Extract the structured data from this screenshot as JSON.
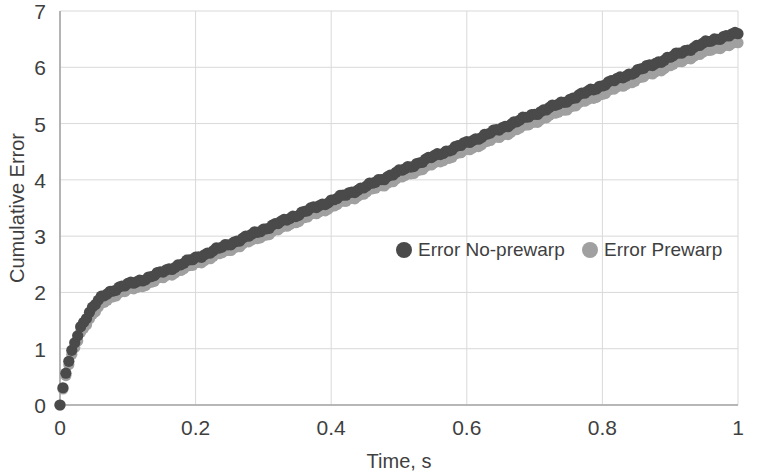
{
  "chart_data": {
    "type": "scatter",
    "title": "",
    "xlabel": "Time, s",
    "ylabel": "Cumulative Error",
    "xlim": [
      0,
      1
    ],
    "ylim": [
      0,
      7
    ],
    "xticks": [
      "0",
      "0.2",
      "0.4",
      "0.6",
      "0.8",
      "1"
    ],
    "xtick_values": [
      0,
      0.2,
      0.4,
      0.6,
      0.8,
      1
    ],
    "yticks": [
      "0",
      "1",
      "2",
      "3",
      "4",
      "5",
      "6",
      "7"
    ],
    "ytick_values": [
      0,
      1,
      2,
      3,
      4,
      5,
      6,
      7
    ],
    "grid": true,
    "legend_position": "inside-center",
    "marker": "circle",
    "series": [
      {
        "name": "Error No-prewarp",
        "color": "#4a4a4a",
        "x": [
          0.0,
          0.01,
          0.02,
          0.03,
          0.04,
          0.05,
          0.06,
          0.07,
          0.08,
          0.09,
          0.1,
          0.11,
          0.12,
          0.13,
          0.14,
          0.15,
          0.16,
          0.17,
          0.18,
          0.19,
          0.2,
          0.21,
          0.22,
          0.23,
          0.24,
          0.25,
          0.26,
          0.27,
          0.28,
          0.29,
          0.3,
          0.31,
          0.32,
          0.33,
          0.34,
          0.35,
          0.36,
          0.37,
          0.38,
          0.39,
          0.4,
          0.41,
          0.42,
          0.43,
          0.44,
          0.45,
          0.46,
          0.47,
          0.48,
          0.49,
          0.5,
          0.51,
          0.52,
          0.53,
          0.54,
          0.55,
          0.56,
          0.57,
          0.58,
          0.59,
          0.6,
          0.61,
          0.62,
          0.63,
          0.64,
          0.65,
          0.66,
          0.67,
          0.68,
          0.69,
          0.7,
          0.71,
          0.72,
          0.73,
          0.74,
          0.75,
          0.76,
          0.77,
          0.78,
          0.79,
          0.8,
          0.81,
          0.82,
          0.83,
          0.84,
          0.85,
          0.86,
          0.87,
          0.88,
          0.89,
          0.9,
          0.91,
          0.92,
          0.93,
          0.94,
          0.95,
          0.96,
          0.97,
          0.98,
          0.99,
          1.0
        ],
        "y": [
          0.0,
          0.65,
          1.05,
          1.38,
          1.58,
          1.76,
          1.9,
          1.99,
          2.05,
          2.1,
          2.14,
          2.18,
          2.22,
          2.26,
          2.31,
          2.36,
          2.41,
          2.46,
          2.51,
          2.56,
          2.61,
          2.66,
          2.71,
          2.76,
          2.81,
          2.86,
          2.91,
          2.96,
          3.01,
          3.07,
          3.12,
          3.17,
          3.22,
          3.27,
          3.33,
          3.38,
          3.43,
          3.48,
          3.53,
          3.58,
          3.63,
          3.68,
          3.73,
          3.78,
          3.83,
          3.88,
          3.93,
          3.99,
          4.04,
          4.1,
          4.15,
          4.2,
          4.25,
          4.31,
          4.36,
          4.41,
          4.46,
          4.51,
          4.56,
          4.61,
          4.66,
          4.71,
          4.76,
          4.81,
          4.86,
          4.91,
          4.97,
          5.02,
          5.07,
          5.12,
          5.17,
          5.22,
          5.27,
          5.32,
          5.37,
          5.42,
          5.47,
          5.52,
          5.58,
          5.63,
          5.68,
          5.73,
          5.78,
          5.83,
          5.88,
          5.93,
          5.98,
          6.03,
          6.08,
          6.13,
          6.18,
          6.23,
          6.28,
          6.33,
          6.38,
          6.43,
          6.47,
          6.51,
          6.55,
          6.58,
          6.6
        ]
      },
      {
        "name": "Error Prewarp",
        "color": "#a0a0a0",
        "x": [
          0.0,
          0.01,
          0.02,
          0.03,
          0.04,
          0.05,
          0.06,
          0.07,
          0.08,
          0.09,
          0.1,
          0.11,
          0.12,
          0.13,
          0.14,
          0.15,
          0.16,
          0.17,
          0.18,
          0.19,
          0.2,
          0.21,
          0.22,
          0.23,
          0.24,
          0.25,
          0.26,
          0.27,
          0.28,
          0.29,
          0.3,
          0.31,
          0.32,
          0.33,
          0.34,
          0.35,
          0.36,
          0.37,
          0.38,
          0.39,
          0.4,
          0.41,
          0.42,
          0.43,
          0.44,
          0.45,
          0.46,
          0.47,
          0.48,
          0.49,
          0.5,
          0.51,
          0.52,
          0.53,
          0.54,
          0.55,
          0.56,
          0.57,
          0.58,
          0.59,
          0.6,
          0.61,
          0.62,
          0.63,
          0.64,
          0.65,
          0.66,
          0.67,
          0.68,
          0.69,
          0.7,
          0.71,
          0.72,
          0.73,
          0.74,
          0.75,
          0.76,
          0.77,
          0.78,
          0.79,
          0.8,
          0.81,
          0.82,
          0.83,
          0.84,
          0.85,
          0.86,
          0.87,
          0.88,
          0.89,
          0.9,
          0.91,
          0.92,
          0.93,
          0.94,
          0.95,
          0.96,
          0.97,
          0.98,
          0.99,
          1.0
        ],
        "y": [
          0.0,
          0.6,
          0.97,
          1.28,
          1.47,
          1.63,
          1.78,
          1.88,
          1.95,
          2.0,
          2.04,
          2.08,
          2.12,
          2.16,
          2.21,
          2.26,
          2.31,
          2.36,
          2.41,
          2.46,
          2.51,
          2.56,
          2.61,
          2.66,
          2.71,
          2.76,
          2.81,
          2.86,
          2.91,
          2.96,
          3.01,
          3.06,
          3.11,
          3.16,
          3.22,
          3.27,
          3.32,
          3.37,
          3.42,
          3.47,
          3.52,
          3.57,
          3.62,
          3.67,
          3.72,
          3.77,
          3.83,
          3.88,
          3.93,
          3.98,
          4.03,
          4.08,
          4.13,
          4.18,
          4.23,
          4.28,
          4.33,
          4.38,
          4.43,
          4.48,
          4.53,
          4.58,
          4.63,
          4.68,
          4.73,
          4.78,
          4.83,
          4.88,
          4.93,
          4.98,
          5.03,
          5.08,
          5.13,
          5.18,
          5.23,
          5.28,
          5.33,
          5.38,
          5.43,
          5.48,
          5.53,
          5.58,
          5.63,
          5.68,
          5.73,
          5.78,
          5.83,
          5.88,
          5.93,
          5.98,
          6.03,
          6.08,
          6.13,
          6.18,
          6.22,
          6.27,
          6.31,
          6.35,
          6.38,
          6.41,
          6.44
        ]
      }
    ]
  },
  "legend": {
    "items": [
      {
        "label": "Error No-prewarp",
        "color": "#4a4a4a"
      },
      {
        "label": "Error Prewarp",
        "color": "#a0a0a0"
      }
    ]
  },
  "style": {
    "grid_color": "#d9d9d9",
    "axis_color": "#a6a6a6",
    "text_color": "#3f3f3f",
    "background": "#ffffff"
  }
}
